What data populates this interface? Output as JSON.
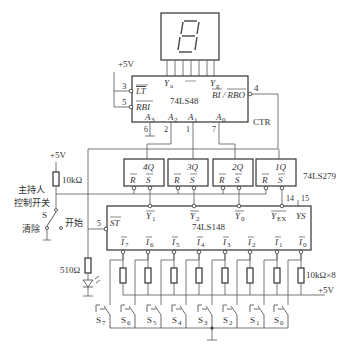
{
  "diagram": {
    "display": {
      "digit": "9",
      "seg_pins": 7
    },
    "decoder": {
      "name": "74LS48",
      "pins": {
        "LT": "3",
        "RBI": "5",
        "BIRBO": "4",
        "A3": "6",
        "A2": "2",
        "A1": "1",
        "A0": "7"
      },
      "labels": {
        "LT": "LT",
        "RBI": "RBI",
        "BIRBO": "BI / RBO",
        "Ya": "Y",
        "Ya_sub": "a",
        "Yg": "Y",
        "Yg_sub": "g",
        "A3": "A",
        "A3s": "3",
        "A2": "A",
        "A2s": "2",
        "A1": "A",
        "A1s": "1",
        "A0": "A",
        "A0s": "0"
      },
      "ctr_label": "CTR",
      "supply": "+5V"
    },
    "latch": {
      "name": "74LS279",
      "cells": [
        {
          "q": "4Q",
          "r": "R",
          "s": "S"
        },
        {
          "q": "3Q",
          "r": "R",
          "s": "S"
        },
        {
          "q": "2Q",
          "r": "R",
          "s": "S"
        },
        {
          "q": "1Q",
          "r": "R",
          "s": "S"
        }
      ]
    },
    "encoder": {
      "name": "74LS148",
      "st_label": "ST",
      "st_pin": "5",
      "outputs": [
        {
          "label": "Y",
          "sub": "1"
        },
        {
          "label": "Y",
          "sub": "2"
        },
        {
          "label": "Y",
          "sub": "0"
        },
        {
          "label": "Y",
          "sub": "EX"
        },
        {
          "label": "YS",
          "sub": ""
        }
      ],
      "yex_pin": "14",
      "ys_pin": "15",
      "inputs": [
        {
          "label": "I",
          "sub": "7"
        },
        {
          "label": "I",
          "sub": "6"
        },
        {
          "label": "I",
          "sub": "5"
        },
        {
          "label": "I",
          "sub": "4"
        },
        {
          "label": "I",
          "sub": "3"
        },
        {
          "label": "I",
          "sub": "2"
        },
        {
          "label": "I",
          "sub": "1"
        },
        {
          "label": "I",
          "sub": "0"
        }
      ]
    },
    "host": {
      "supply": "+5V",
      "pullup": "10kΩ",
      "title_line1": "主持人",
      "title_line2": "控制开关",
      "switch": "S",
      "clear": "清除",
      "start": "开始",
      "led_resistor": "510Ω"
    },
    "switches": {
      "resistor_label": "10kΩ×8",
      "supply": "+5V",
      "items": [
        {
          "label": "S",
          "sub": "7"
        },
        {
          "label": "S",
          "sub": "6"
        },
        {
          "label": "S",
          "sub": "5"
        },
        {
          "label": "S",
          "sub": "4"
        },
        {
          "label": "S",
          "sub": "3"
        },
        {
          "label": "S",
          "sub": "2"
        },
        {
          "label": "S",
          "sub": "1"
        },
        {
          "label": "S",
          "sub": "0"
        }
      ]
    }
  }
}
